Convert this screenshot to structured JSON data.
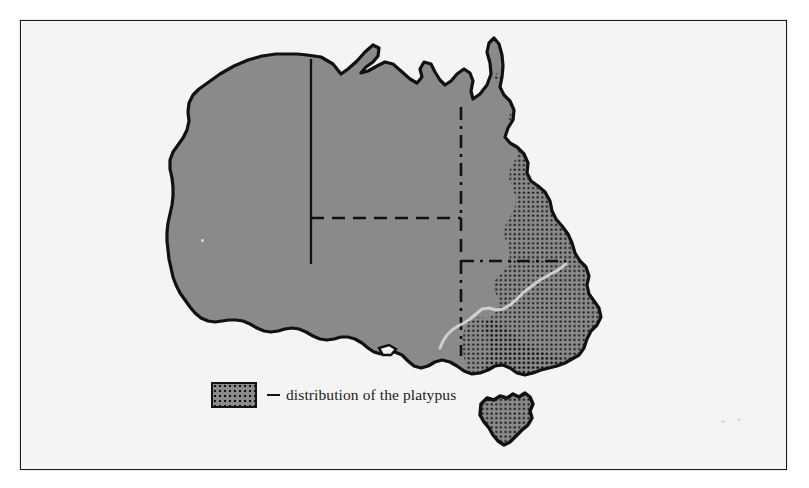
{
  "figure": {
    "kind": "thematic-distribution-map",
    "region": "Australia",
    "frame": {
      "border_color": "#1a1a1a",
      "paper_color": "#f4f4f5",
      "outside_color": "#ffffff"
    }
  },
  "map": {
    "land_fill": "#8a8a8a",
    "coast_stroke": "#111111",
    "ocean_fill": "#f4f4f5",
    "river_stroke": "#cfcfcf",
    "border_stroke": "#111111",
    "dot_color": "#101010",
    "landmasses": [
      {
        "name": "mainland-australia",
        "label": "Australia mainland"
      },
      {
        "name": "tasmania",
        "label": "Tasmania"
      },
      {
        "name": "kangaroo-island",
        "label": "Kangaroo Island"
      }
    ],
    "state_borders": [
      {
        "name": "wa-nt-sa-border",
        "style": "solid"
      },
      {
        "name": "nt-qld-border",
        "style": "dash-dot"
      },
      {
        "name": "nt-sa-wa-border",
        "style": "dashed"
      },
      {
        "name": "qld-sa-nsw-border",
        "style": "dashed"
      },
      {
        "name": "sa-nsw-vic-border",
        "style": "dash-dot"
      }
    ],
    "rivers": [
      {
        "name": "murray-darling-river",
        "label": "Murray River"
      }
    ],
    "distribution_overlay": {
      "name": "platypus-distribution",
      "pattern": "black dot stipple",
      "covers": [
        "eastern Queensland",
        "eastern New South Wales",
        "Victoria",
        "Tasmania"
      ]
    }
  },
  "legend": {
    "swatch_name": "distribution-swatch",
    "dash": "–",
    "label": "distribution of the platypus",
    "swatch_fill": "#8a8a8a",
    "swatch_border": "#141414"
  }
}
